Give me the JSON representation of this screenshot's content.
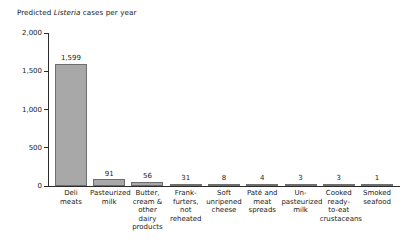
{
  "chart_data": {
    "type": "bar",
    "title_prefix": "Predicted ",
    "title_italic": "Listeria",
    "title_suffix": " cases per year",
    "title": "Predicted Listeria cases per year",
    "xlabel": "",
    "ylabel": "",
    "ylim": [
      0,
      2000
    ],
    "grid": false,
    "legend": null,
    "ytick_labels": [
      "2,000",
      "1,500",
      "1,000",
      "500",
      "0"
    ],
    "ytick_values": [
      2000,
      1500,
      1000,
      500,
      0
    ],
    "categories": [
      "Deli meats",
      "Pasteurized milk",
      "Butter, cream & other dairy products",
      "Frank-furters, not reheated",
      "Soft unripened cheese",
      "Paté and meat spreads",
      "Un-pasteurized milk",
      "Cooked ready-to-eat crustaceans",
      "Smoked seafood"
    ],
    "category_lines": [
      [
        "Deli",
        "meats"
      ],
      [
        "Pasteurized",
        "milk"
      ],
      [
        "Butter,",
        "cream &",
        "other dairy",
        "products"
      ],
      [
        "Frank-",
        "furters,",
        "not",
        "reheated"
      ],
      [
        "Soft",
        "unripened",
        "cheese"
      ],
      [
        "Paté and",
        "meat",
        "spreads"
      ],
      [
        "Un-",
        "pasteurized",
        "milk"
      ],
      [
        "Cooked",
        "ready-",
        "to-eat",
        "crustaceans"
      ],
      [
        "Smoked",
        "seafood"
      ]
    ],
    "values": [
      1599,
      91,
      56,
      31,
      8,
      4,
      3,
      3,
      1
    ],
    "value_labels": [
      "1,599",
      "91",
      "56",
      "31",
      "8",
      "4",
      "3",
      "3",
      "1"
    ],
    "bar_color": "#a8a8a8",
    "bar_edge_color": "#6e6e6e",
    "axis_color": "#2b2b2b",
    "text_color": "#1a1a1a",
    "background": "#ffffff"
  }
}
